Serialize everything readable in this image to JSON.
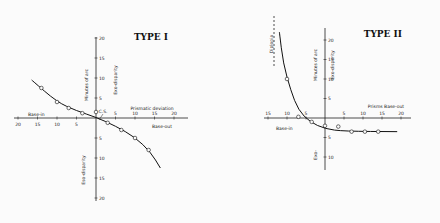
{
  "chart_data": [
    {
      "type": "scatter",
      "title": "TYPE I",
      "xlabel": "Prismatic deviation",
      "x_left_label": "Base-in",
      "x_right_label": "Base-out",
      "ylabel": "Minutes of arc",
      "y_upper_label": "Exo-disparity",
      "y_lower_label": "Eso-disparity",
      "annotation": "C.S.",
      "x_ticks": [
        -20,
        -15,
        -10,
        -5,
        5,
        10,
        15,
        20
      ],
      "x_tick_labels": [
        "20",
        "15",
        "10",
        "5",
        "5",
        "10",
        "15",
        "20"
      ],
      "y_ticks": [
        20,
        15,
        10,
        5,
        -5,
        -10,
        -15,
        -20
      ],
      "y_tick_labels": [
        "20",
        "15",
        "10",
        "5",
        "5",
        "10",
        "15",
        "20"
      ],
      "xlim": [
        -22,
        22
      ],
      "ylim": [
        -21,
        21
      ],
      "points": [
        {
          "x": -14,
          "y": 7.5
        },
        {
          "x": -10,
          "y": 4
        },
        {
          "x": -7,
          "y": 2.5
        },
        {
          "x": -3.5,
          "y": 1.2
        },
        {
          "x": 0,
          "y": 1.5
        },
        {
          "x": 3,
          "y": -1.2
        },
        {
          "x": 6.5,
          "y": -3
        },
        {
          "x": 10,
          "y": -5
        },
        {
          "x": 13.5,
          "y": -8
        }
      ],
      "curve": [
        {
          "x": -16.5,
          "y": 9.5
        },
        {
          "x": -10,
          "y": 4
        },
        {
          "x": -5,
          "y": 1.8
        },
        {
          "x": 0,
          "y": 0.2
        },
        {
          "x": 5,
          "y": -2
        },
        {
          "x": 10,
          "y": -4.8
        },
        {
          "x": 14,
          "y": -8.5
        },
        {
          "x": 16.5,
          "y": -12.5
        }
      ]
    },
    {
      "type": "scatter",
      "title": "TYPE II",
      "xlabel": "Prisms Base-out",
      "x_left_label": "Base-in",
      "ylabel": "Minutes of arc",
      "y_upper_label": "Exo-disparity",
      "y_lower_label": "Exo-",
      "annotation": "Diplopia",
      "x_ticks": [
        -15,
        -10,
        -5,
        5,
        10,
        15,
        20
      ],
      "x_tick_labels": [
        "15",
        "10",
        "5",
        "5",
        "10",
        "15",
        "20"
      ],
      "y_ticks": [
        20,
        15,
        10,
        5,
        -5,
        -10
      ],
      "y_tick_labels": [
        "20",
        "15",
        "10",
        "5",
        "5",
        "10"
      ],
      "xlim": [
        -17,
        22
      ],
      "ylim": [
        -12,
        22
      ],
      "points": [
        {
          "x": -10,
          "y": 10
        },
        {
          "x": -7,
          "y": 0.3
        },
        {
          "x": -3.5,
          "y": -1
        },
        {
          "x": 0,
          "y": -2
        },
        {
          "x": 3.5,
          "y": -2.2
        },
        {
          "x": 7,
          "y": -3.5
        },
        {
          "x": 10.5,
          "y": -3.5
        },
        {
          "x": 14,
          "y": -3.5
        }
      ],
      "curve": [
        {
          "x": -12,
          "y": 22
        },
        {
          "x": -11,
          "y": 14
        },
        {
          "x": -9,
          "y": 7
        },
        {
          "x": -7,
          "y": 2
        },
        {
          "x": -4,
          "y": -1
        },
        {
          "x": 0,
          "y": -2.8
        },
        {
          "x": 5,
          "y": -3.4
        },
        {
          "x": 19,
          "y": -3.5
        }
      ]
    }
  ]
}
